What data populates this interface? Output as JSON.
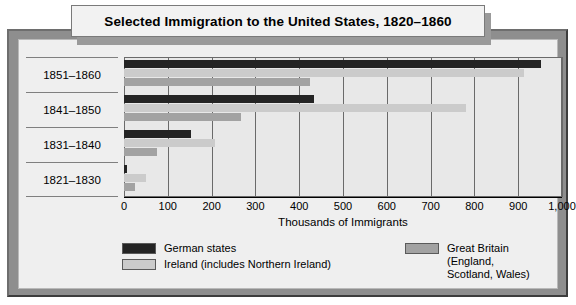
{
  "title": "Selected Immigration to the United States, 1820–1860",
  "chart_data": {
    "type": "bar",
    "orientation": "horizontal",
    "title": "Selected Immigration to the United States, 1820–1860",
    "xlabel": "Thousands of Immigrants",
    "ylabel": "",
    "xlim": [
      0,
      1000
    ],
    "xticks": [
      0,
      100,
      200,
      300,
      400,
      500,
      600,
      700,
      800,
      900,
      1000
    ],
    "xtick_labels": [
      "0",
      "100",
      "200",
      "300",
      "400",
      "500",
      "600",
      "700",
      "800",
      "900",
      "1,000"
    ],
    "grid": true,
    "grid_axis": "x",
    "legend_position": "bottom",
    "categories": [
      "1851–1860",
      "1841–1850",
      "1831–1840",
      "1821–1830"
    ],
    "series": [
      {
        "name": "German states",
        "color": "#242424",
        "values": [
          951,
          434,
          152,
          6
        ]
      },
      {
        "name": "Ireland (includes Northern Ireland)",
        "color": "#cbcbcb",
        "values": [
          914,
          781,
          207,
          51
        ]
      },
      {
        "name": "Great Britain (England, Scotland, Wales)",
        "color": "#a2a2a2",
        "values": [
          424,
          267,
          76,
          25
        ]
      }
    ]
  },
  "axis": {
    "x_title": "Thousands of Immigrants",
    "ticks": [
      {
        "value": 0,
        "label": "0"
      },
      {
        "value": 100,
        "label": "100"
      },
      {
        "value": 200,
        "label": "200"
      },
      {
        "value": 300,
        "label": "300"
      },
      {
        "value": 400,
        "label": "400"
      },
      {
        "value": 500,
        "label": "500"
      },
      {
        "value": 600,
        "label": "600"
      },
      {
        "value": 700,
        "label": "700"
      },
      {
        "value": 800,
        "label": "800"
      },
      {
        "value": 900,
        "label": "900"
      },
      {
        "value": 1000,
        "label": "1,000"
      }
    ]
  },
  "rows": [
    {
      "label": "1851–1860"
    },
    {
      "label": "1841–1850"
    },
    {
      "label": "1831–1840"
    },
    {
      "label": "1821–1830"
    }
  ],
  "legend": {
    "items": [
      {
        "label": "German states",
        "color": "#242424",
        "swatch": "german"
      },
      {
        "label": "Ireland (includes Northern Ireland)",
        "color": "#cbcbcb",
        "swatch": "ireland"
      },
      {
        "label": "Great Britain (England,\nScotland, Wales)",
        "color": "#a2a2a2",
        "swatch": "britain"
      }
    ]
  },
  "colors": {
    "german": "#242424",
    "ireland": "#cbcbcb",
    "britain": "#a2a2a2",
    "frame": "#8e8e8e",
    "panel": "#efefef",
    "plot_background": "#e8e8e8"
  }
}
